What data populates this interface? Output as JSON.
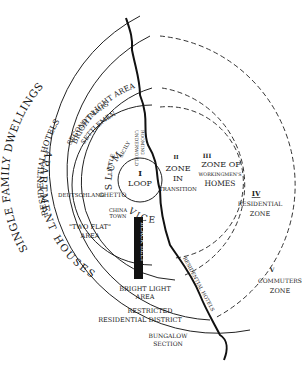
{
  "diagram": {
    "zones": [
      {
        "numeral": "I",
        "name": "LOOP"
      },
      {
        "numeral": "II",
        "name_lines": [
          "ZONE",
          "IN",
          "TRANSITION"
        ]
      },
      {
        "numeral": "III",
        "name_lines": [
          "ZONE OF",
          "WORKINGMEN'S",
          "HOMES"
        ]
      },
      {
        "numeral": "IV",
        "name_lines": [
          "RESIDENTIAL",
          "ZONE"
        ]
      },
      {
        "numeral": "V",
        "name_lines": [
          "COMMUTERS",
          "ZONE"
        ]
      }
    ],
    "labels": {
      "single_family": "SINGLE FAMILY DWELLINGS",
      "residential_hotels": "RESIDENTIAL HOTELS",
      "bright_light_area": "BRIGHT LIGHT AREA",
      "apartment_houses": "APARTMENT HOUSES",
      "second_immigrant": "SECOND IMMIGRANT",
      "settlement": "SETTLEMENT",
      "little_sicily_1": "LITTLE",
      "little_sicily_2": "SICILY",
      "underworld": "UNDERWORLD",
      "rooming": "ROOMING",
      "slum": "SLUM",
      "vice": "VICE",
      "deutschland": "DEUTSCHLAND",
      "ghetto": "GHETTO",
      "china_1": "CHINA",
      "china_2": "TOWN",
      "two_flat_1": "\"TWO FLAT\"",
      "two_flat_2": "AREA",
      "black_belt": "BLACK BELT",
      "bright_light_1": "BRIGHT LIGHT",
      "bright_light_2": "AREA",
      "restricted_1": "RESTRICTED",
      "restricted_2": "RESIDENTIAL DISTRICT",
      "bungalow_1": "BUNGALOW",
      "bungalow_2": "SECTION",
      "residential_hotels_right": "RESIDENTIAL HOTELS"
    }
  }
}
